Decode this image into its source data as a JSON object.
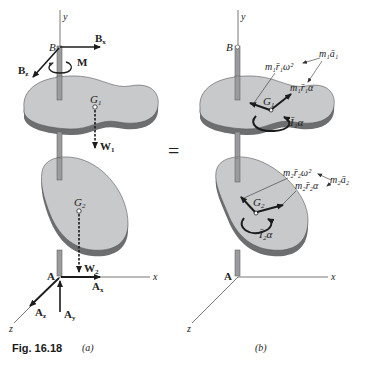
{
  "figure": {
    "caption": "Fig. 16.18",
    "panel_a_label": "(a)",
    "panel_b_label": "(b)",
    "equals_sign": "="
  },
  "panel_a": {
    "axis_y": "y",
    "axis_x": "x",
    "axis_z": "z",
    "point_B": "B",
    "point_A": "A",
    "force_Bx": "B",
    "force_Bx_sub": "x",
    "force_Bz": "B",
    "force_Bz_sub": "z",
    "moment_M": "M",
    "centroid_G1": "G",
    "centroid_G1_sub": "1",
    "weight_W1": "W",
    "weight_W1_sub": "1",
    "centroid_G2": "G",
    "centroid_G2_sub": "2",
    "weight_W2": "W",
    "weight_W2_sub": "2",
    "force_Ax": "A",
    "force_Ax_sub": "x",
    "force_Ay": "A",
    "force_Ay_sub": "y",
    "force_Az": "A",
    "force_Az_sub": "z"
  },
  "panel_b": {
    "axis_y": "y",
    "axis_x": "x",
    "axis_z": "z",
    "point_B": "B",
    "point_A": "A",
    "centroid_G1": "G",
    "centroid_G1_sub": "1",
    "centroid_G2": "G",
    "centroid_G2_sub": "2",
    "label_m1a1": "m₁ā₁",
    "label_m1r1w2": "m₁r̄₁ω²",
    "label_m1r1a": "m₁r̄₁α",
    "label_I1a": "Ī₁α",
    "label_m2a2": "m₂ā₂",
    "label_m2r2w2": "m₂r̄₂ω²",
    "label_m2r2a": "m₂r̄₂α",
    "label_I2a": "Ī₂α"
  },
  "colors": {
    "plate_fill": "#c8c9cb",
    "plate_edge": "#6d6e70",
    "shaft": "#9a9b9d",
    "vector": "#1c1c1c",
    "axis": "#555555"
  }
}
